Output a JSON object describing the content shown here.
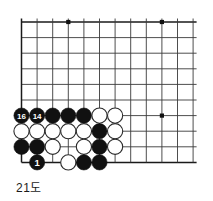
{
  "figure": {
    "caption": "21도",
    "kind": "go-board-diagram"
  },
  "board": {
    "grid": {
      "cols": 12,
      "rows": 10,
      "spacing": 15.6,
      "origin_x": 21.5,
      "origin_y": 22.0,
      "line_color": "#3a3a3a",
      "edge_color": "#1a1a1a",
      "background": "#ffffff"
    },
    "star_points": [
      {
        "col": 3,
        "row": 0
      },
      {
        "col": 9,
        "row": 0
      },
      {
        "col": 9,
        "row": 6
      }
    ],
    "stones": [
      {
        "col": 0,
        "row": 6,
        "color": "black",
        "label": "16"
      },
      {
        "col": 1,
        "row": 6,
        "color": "black",
        "label": "14"
      },
      {
        "col": 2,
        "row": 6,
        "color": "black",
        "label": ""
      },
      {
        "col": 3,
        "row": 6,
        "color": "black",
        "label": ""
      },
      {
        "col": 4,
        "row": 6,
        "color": "black",
        "label": ""
      },
      {
        "col": 5,
        "row": 6,
        "color": "white",
        "label": ""
      },
      {
        "col": 6,
        "row": 6,
        "color": "white",
        "label": ""
      },
      {
        "col": 0,
        "row": 7,
        "color": "white",
        "label": ""
      },
      {
        "col": 1,
        "row": 7,
        "color": "white",
        "label": ""
      },
      {
        "col": 2,
        "row": 7,
        "color": "white",
        "label": ""
      },
      {
        "col": 3,
        "row": 7,
        "color": "white",
        "label": ""
      },
      {
        "col": 4,
        "row": 7,
        "color": "white",
        "label": ""
      },
      {
        "col": 5,
        "row": 7,
        "color": "black",
        "label": ""
      },
      {
        "col": 6,
        "row": 7,
        "color": "white",
        "label": ""
      },
      {
        "col": 0,
        "row": 8,
        "color": "black",
        "label": ""
      },
      {
        "col": 1,
        "row": 8,
        "color": "black",
        "label": ""
      },
      {
        "col": 2,
        "row": 8,
        "color": "white",
        "label": ""
      },
      {
        "col": 4,
        "row": 8,
        "color": "white",
        "label": ""
      },
      {
        "col": 5,
        "row": 8,
        "color": "black",
        "label": ""
      },
      {
        "col": 6,
        "row": 8,
        "color": "white",
        "label": ""
      },
      {
        "col": 1,
        "row": 9,
        "color": "black",
        "label": "1"
      },
      {
        "col": 3,
        "row": 9,
        "color": "white",
        "label": ""
      },
      {
        "col": 4,
        "row": 9,
        "color": "black",
        "label": ""
      },
      {
        "col": 5,
        "row": 9,
        "color": "black",
        "label": ""
      }
    ],
    "stone_style": {
      "radius": 7.6,
      "black_fill": "#111111",
      "white_fill": "#ffffff",
      "white_stroke": "#2a2a2a",
      "black_label_color": "#ffffff",
      "white_label_color": "#111111"
    }
  }
}
